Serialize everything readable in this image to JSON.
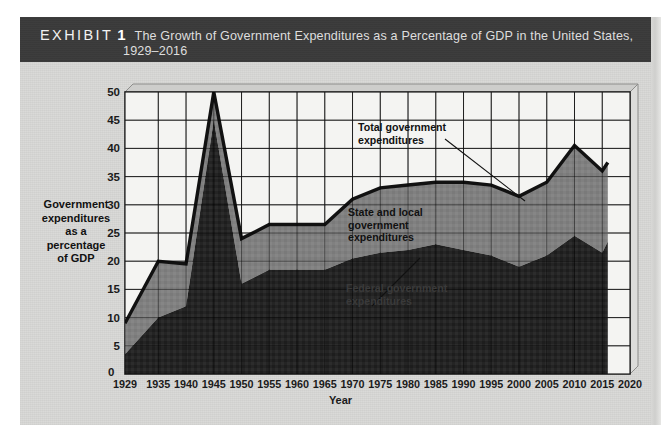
{
  "header": {
    "exhibit_word": "EXHIBIT",
    "exhibit_number": "1",
    "title_line1": "The Growth of Government Expenditures as a Percentage of GDP in the United States,",
    "title_line2": "1929–2016"
  },
  "colors": {
    "header_bar": "#3b3b3b",
    "paper": "#d8d8d6",
    "plot_background": "#f4f4f2",
    "federal_band": "#242424",
    "state_local_band": "#808080",
    "total_line": "#111111",
    "gridline": "#3a3a3a"
  },
  "axes": {
    "y_title": "Government\nexpenditures\nas a\npercentage\nof GDP",
    "y_title_lines": [
      "Government",
      "expenditures",
      "as a",
      "percentage",
      "of GDP"
    ],
    "y_ticks": [
      0,
      5,
      10,
      15,
      20,
      25,
      30,
      35,
      40,
      45,
      50
    ],
    "y_zero_label": "0",
    "x_title": "Year",
    "x_ticks": [
      "1929",
      "1935",
      "1940",
      "1945",
      "1950",
      "1955",
      "1960",
      "1965",
      "1970",
      "1975",
      "1980",
      "1985",
      "1990",
      "1995",
      "2000",
      "2005",
      "2010",
      "2015",
      "2020"
    ]
  },
  "annotations": {
    "total": "Total government\nexpenditures",
    "state_local": "State and local\ngovernment\nexpenditures",
    "federal": "Federal government\nexpenditures"
  },
  "chart_data": {
    "type": "area",
    "title": "The Growth of Government Expenditures as a Percentage of GDP in the United States, 1929–2016",
    "xlabel": "Year",
    "ylabel": "Government expenditures as a percentage of GDP",
    "ylim": [
      0,
      50
    ],
    "xlim": [
      1929,
      2020
    ],
    "grid": true,
    "legend": "inline-annotations",
    "stacked": true,
    "x": [
      1929,
      1935,
      1940,
      1945,
      1950,
      1955,
      1960,
      1965,
      1970,
      1975,
      1980,
      1985,
      1990,
      1995,
      2000,
      2005,
      2010,
      2015,
      2016
    ],
    "series": [
      {
        "name": "Federal government expenditures",
        "color": "#242424",
        "values": [
          3.5,
          10.0,
          12.0,
          45.0,
          16.0,
          18.5,
          18.5,
          18.5,
          20.5,
          21.5,
          22.0,
          23.0,
          22.0,
          21.0,
          19.0,
          21.0,
          24.5,
          21.5,
          23.5
        ]
      },
      {
        "name": "State and local government expenditures",
        "color": "#808080",
        "values": [
          5.5,
          10.0,
          7.5,
          5.0,
          8.0,
          8.0,
          8.0,
          8.0,
          10.5,
          11.5,
          11.5,
          11.0,
          12.0,
          12.5,
          12.5,
          13.0,
          16.0,
          14.5,
          14.0
        ]
      }
    ],
    "total_line": {
      "name": "Total government expenditures",
      "color": "#111111",
      "values": [
        9.0,
        20.0,
        19.5,
        50.0,
        24.0,
        26.5,
        26.5,
        26.5,
        31.0,
        33.0,
        33.5,
        34.0,
        34.0,
        33.5,
        31.5,
        34.0,
        40.5,
        36.0,
        37.5
      ]
    }
  }
}
